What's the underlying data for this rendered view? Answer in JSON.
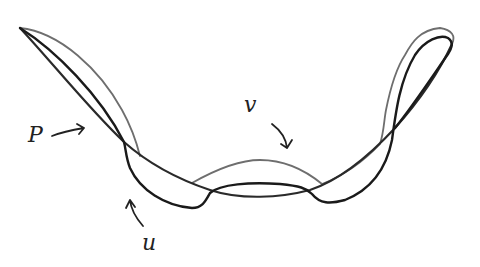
{
  "diagram": {
    "colors": {
      "background": "#ffffff",
      "curve_P": "#2a2a2a",
      "curve_u": "#1a1a1a",
      "curve_v": "#6e6e6e",
      "labels": "#222222"
    },
    "labels": {
      "P": "P",
      "u": "u",
      "v": "v"
    },
    "curves": [
      {
        "id": "P",
        "style": "dark, medium stroke, long diagonal from upper-left tip down across the bottom and up to right loop"
      },
      {
        "id": "u",
        "style": "black, thick stroke, lower loop with dips near bottom-left and bottom-right"
      },
      {
        "id": "v",
        "style": "gray, thin stroke, upper outline including central hump and outer boundary of right lobe"
      }
    ]
  }
}
